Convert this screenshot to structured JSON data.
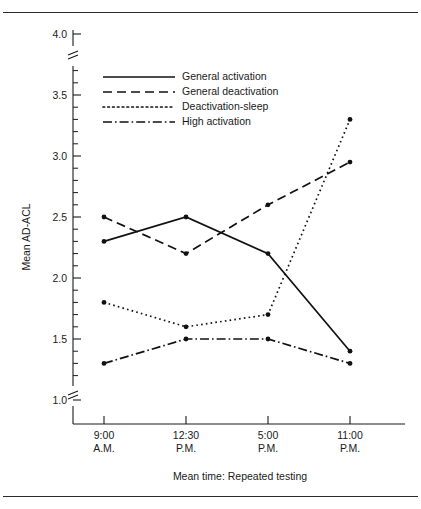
{
  "figure": {
    "top_caption_fragment": "",
    "border_color": "#2b2b2b"
  },
  "chart_data": {
    "type": "line",
    "title": "",
    "xlabel": "Mean time: Repeated testing",
    "ylabel": "Mean AD-ACL",
    "categories": [
      "9:00 A.M.",
      "12:30 P.M.",
      "5:00 P.M.",
      "11:00 P.M."
    ],
    "category_lines": [
      [
        "9:00",
        "A.M."
      ],
      [
        "12:30",
        "P.M."
      ],
      [
        "5:00",
        "P.M."
      ],
      [
        "11:00",
        "P.M."
      ]
    ],
    "ylim": [
      1.0,
      4.0
    ],
    "ytick_labels": [
      "1.0",
      "1.5",
      "2.0",
      "2.5",
      "3.0",
      "3.5",
      "4.0"
    ],
    "ytick_values": [
      1.0,
      1.5,
      2.0,
      2.5,
      3.0,
      3.5,
      4.0
    ],
    "yminor_step": 0.1,
    "grid": false,
    "axis_break_top": true,
    "axis_break_bottom": true,
    "legend_position": "upper-left-inside",
    "series": [
      {
        "name": "General activation",
        "style": "solid",
        "values": [
          2.3,
          2.5,
          2.2,
          1.4
        ]
      },
      {
        "name": "General deactivation",
        "style": "dashed",
        "values": [
          2.5,
          2.2,
          2.6,
          2.95
        ]
      },
      {
        "name": "Deactivation-sleep",
        "style": "dotted",
        "values": [
          1.8,
          1.6,
          1.7,
          3.3
        ]
      },
      {
        "name": "High activation",
        "style": "dashdot",
        "values": [
          1.3,
          1.5,
          1.5,
          1.3
        ]
      }
    ]
  }
}
